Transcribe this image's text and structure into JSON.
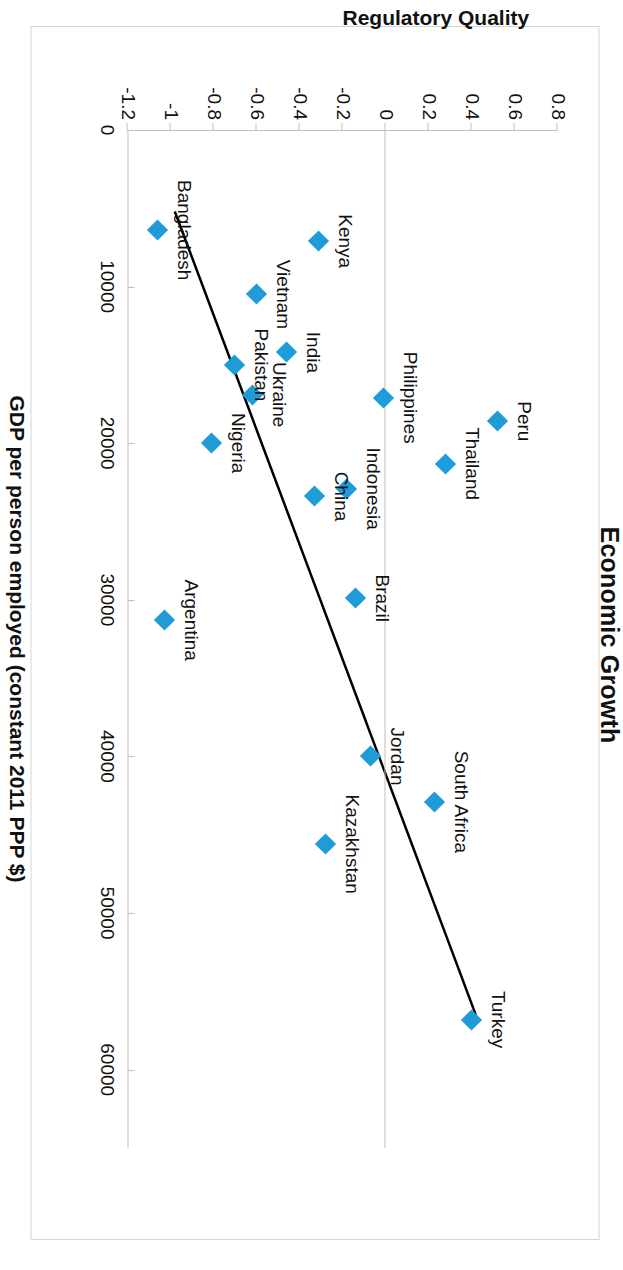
{
  "chart_data": {
    "type": "scatter",
    "title": "Economic Growth",
    "xlabel": "GDP per person employed (constant 2011 PPP $)",
    "ylabel": "Regulatory Quality",
    "xlim": [
      0,
      65000
    ],
    "ylim": [
      -1.2,
      0.8
    ],
    "xticks": [
      0,
      10000,
      20000,
      30000,
      40000,
      50000,
      60000
    ],
    "xtick_labels": [
      "0",
      "10000",
      "20000",
      "30000",
      "40000",
      "50000",
      "60000"
    ],
    "yticks": [
      0.8,
      0.6,
      0.4,
      0.2,
      0,
      -0.2,
      -0.4,
      -0.6,
      -0.8,
      -1,
      -1.2
    ],
    "ytick_labels": [
      "0.8",
      "0.6",
      "0.4",
      "0.2",
      "0",
      "-0.2",
      "-0.4",
      "-0.6",
      "-0.8",
      "-1",
      "-1.2"
    ],
    "grid": false,
    "legend": "none",
    "marker_color": "#1f9bd8",
    "trendline_color": "#000000",
    "trendline": {
      "x1": 5200,
      "y1": -0.98,
      "x2": 56500,
      "y2": 0.42
    },
    "points": [
      {
        "label": "Turkey",
        "x": 56800,
        "y": 0.4,
        "label_dx": 0,
        "label_dy": -26
      },
      {
        "label": "South Africa",
        "x": 42900,
        "y": 0.23,
        "label_dx": 0,
        "label_dy": -26
      },
      {
        "label": "Jordan",
        "x": 40000,
        "y": -0.07,
        "label_dx": 0,
        "label_dy": -26
      },
      {
        "label": "Kazakhstan",
        "x": 45600,
        "y": -0.28,
        "label_dx": 0,
        "label_dy": -26
      },
      {
        "label": "Peru",
        "x": 18600,
        "y": 0.52,
        "label_dx": 0,
        "label_dy": -26
      },
      {
        "label": "Thailand",
        "x": 21300,
        "y": 0.28,
        "label_dx": 0,
        "label_dy": -26
      },
      {
        "label": "Brazil",
        "x": 29900,
        "y": -0.14,
        "label_dx": 0,
        "label_dy": -26
      },
      {
        "label": "Indonesia",
        "x": 22900,
        "y": -0.18,
        "label_dx": 0,
        "label_dy": -26
      },
      {
        "label": "Philippines",
        "x": 17100,
        "y": -0.01,
        "label_dx": 0,
        "label_dy": -26
      },
      {
        "label": "China",
        "x": 23400,
        "y": -0.33,
        "label_dx": 0,
        "label_dy": -26
      },
      {
        "label": "Argentina",
        "x": 31300,
        "y": -1.03,
        "label_dx": 0,
        "label_dy": -26
      },
      {
        "label": "Nigeria",
        "x": 20000,
        "y": -0.81,
        "label_dx": 0,
        "label_dy": -26
      },
      {
        "label": "Ukraine",
        "x": 16900,
        "y": -0.62,
        "label_dx": 0,
        "label_dy": -26
      },
      {
        "label": "Pakistan",
        "x": 15000,
        "y": -0.7,
        "label_dx": 0,
        "label_dy": -26
      },
      {
        "label": "India",
        "x": 14200,
        "y": -0.46,
        "label_dx": 0,
        "label_dy": -26
      },
      {
        "label": "Vietnam",
        "x": 10500,
        "y": -0.6,
        "label_dx": 0,
        "label_dy": -26
      },
      {
        "label": "Kenya",
        "x": 7100,
        "y": -0.31,
        "label_dx": 0,
        "label_dy": -26
      },
      {
        "label": "Bangladesh",
        "x": 6400,
        "y": -1.06,
        "label_dx": 0,
        "label_dy": -26
      }
    ]
  }
}
